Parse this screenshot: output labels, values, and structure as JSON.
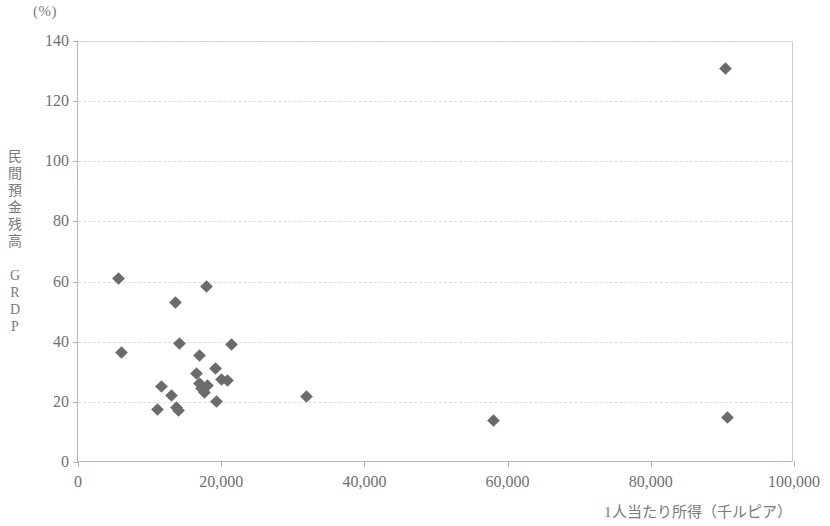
{
  "chart_data": {
    "type": "scatter",
    "title": "",
    "unit_label": "(%)",
    "xlabel": "1人当たり所得（千ルピア）",
    "ylabel": "民間預金残高／GRDP",
    "ylabel_chars": "民\n間\n預\n金\n残\n高\n\nG\nR\nD\nP",
    "xlim": [
      0,
      100000
    ],
    "ylim": [
      0,
      140
    ],
    "xticks": [
      0,
      20000,
      40000,
      60000,
      80000,
      100000
    ],
    "xticklabels": [
      "0",
      "20,000",
      "40,000",
      "60,000",
      "80,000",
      "100,000"
    ],
    "yticks": [
      0,
      20,
      40,
      60,
      80,
      100,
      120,
      140
    ],
    "yticklabels": [
      "0",
      "20",
      "40",
      "60",
      "80",
      "100",
      "120",
      "140"
    ],
    "grid": "horizontal-dashed",
    "legend": "none",
    "marker": "diamond",
    "marker_color": "#6b6b6b",
    "points": [
      {
        "x": 5700,
        "y": 61.0
      },
      {
        "x": 6100,
        "y": 36.5
      },
      {
        "x": 13600,
        "y": 53.0
      },
      {
        "x": 17900,
        "y": 58.5
      },
      {
        "x": 14200,
        "y": 39.5
      },
      {
        "x": 21400,
        "y": 39.0
      },
      {
        "x": 16900,
        "y": 35.5
      },
      {
        "x": 11600,
        "y": 25.0
      },
      {
        "x": 13100,
        "y": 22.0
      },
      {
        "x": 11100,
        "y": 17.5
      },
      {
        "x": 13700,
        "y": 18.0
      },
      {
        "x": 14000,
        "y": 17.0
      },
      {
        "x": 16500,
        "y": 29.5
      },
      {
        "x": 17000,
        "y": 26.0
      },
      {
        "x": 17300,
        "y": 24.5
      },
      {
        "x": 17600,
        "y": 23.0
      },
      {
        "x": 18100,
        "y": 25.5
      },
      {
        "x": 19200,
        "y": 31.0
      },
      {
        "x": 20100,
        "y": 27.5
      },
      {
        "x": 20900,
        "y": 27.0
      },
      {
        "x": 19400,
        "y": 20.0
      },
      {
        "x": 31900,
        "y": 21.8
      },
      {
        "x": 58000,
        "y": 13.8
      },
      {
        "x": 90500,
        "y": 131.0
      },
      {
        "x": 90700,
        "y": 14.8
      }
    ]
  }
}
